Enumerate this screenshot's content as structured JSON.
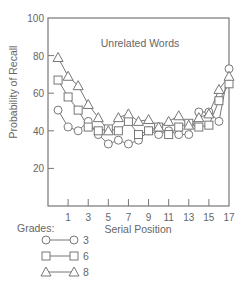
{
  "chart_data": {
    "type": "line",
    "title": "Unrelated Words",
    "xlabel": "Serial Position",
    "ylabel": "Probability of Recall",
    "ylim": [
      0,
      100
    ],
    "xlim": [
      -1,
      17
    ],
    "yticks": [
      20,
      40,
      60,
      80,
      100
    ],
    "xticks": [
      1,
      3,
      5,
      7,
      9,
      11,
      13,
      15,
      17
    ],
    "grid": false,
    "legend_title": "Grades:",
    "legend_position": "bottom-left",
    "x": [
      0,
      1,
      2,
      3,
      4,
      5,
      6,
      7,
      8,
      9,
      10,
      11,
      12,
      13,
      14,
      15,
      16,
      17
    ],
    "series": [
      {
        "name": "3",
        "marker": "circle",
        "values": [
          51,
          42,
          40,
          45,
          38,
          33,
          35,
          33,
          35,
          40,
          38,
          40,
          38,
          38,
          50,
          50,
          45,
          73
        ]
      },
      {
        "name": "6",
        "marker": "square",
        "values": [
          67,
          58,
          51,
          42,
          40,
          41,
          40,
          45,
          38,
          40,
          42,
          38,
          42,
          44,
          42,
          43,
          56,
          65
        ]
      },
      {
        "name": "8",
        "marker": "triangle",
        "values": [
          79,
          69,
          64,
          54,
          47,
          40,
          47,
          49,
          45,
          46,
          42,
          45,
          48,
          43,
          47,
          49,
          62,
          69
        ]
      }
    ]
  }
}
